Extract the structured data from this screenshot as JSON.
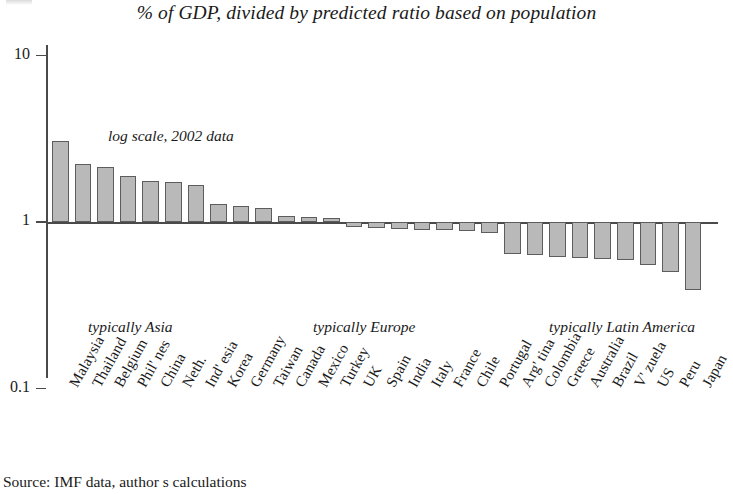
{
  "title": "% of GDP, divided by predicted ratio based on population",
  "annotation": "log scale, 2002 data",
  "source": "Source: IMF data, author s calculations",
  "axis": {
    "ticks": [
      {
        "label": "10",
        "value": 10
      },
      {
        "label": "1",
        "value": 1
      },
      {
        "label": "0.1",
        "value": 0.1
      }
    ]
  },
  "regions": [
    {
      "label": "typically Asia",
      "x": 88
    },
    {
      "label": "typically Europe",
      "x": 313
    },
    {
      "label": "typically Latin America",
      "x": 549
    }
  ],
  "chart_data": {
    "type": "bar",
    "title": "% of GDP, divided by predicted ratio based on population",
    "subtitle": "log scale, 2002 data",
    "xlabel": "",
    "ylabel": "",
    "yscale": "log",
    "ylim": [
      0.1,
      10
    ],
    "yticks": [
      0.1,
      1,
      10
    ],
    "grid": false,
    "legend": null,
    "baseline": 1,
    "source": "Source: IMF data, author s calculations",
    "annotations": [
      "typically Asia",
      "typically Europe",
      "typically Latin America"
    ],
    "categories": [
      "Malaysia",
      "Thailand",
      "Belgium",
      "Phil' nes",
      "China",
      "Neth.",
      "Ind' esia",
      "Korea",
      "Germany",
      "Taiwan",
      "Canada",
      "Mexico",
      "Turkey",
      "UK",
      "Spain",
      "India",
      "Italy",
      "France",
      "Chile",
      "Portugal",
      "Arg' tina",
      "Colombia",
      "Greece",
      "Australia",
      "Brazil",
      "V' zuela",
      "US",
      "Peru",
      "Japan"
    ],
    "values": [
      3.05,
      2.22,
      2.15,
      1.88,
      1.76,
      1.74,
      1.66,
      1.28,
      1.25,
      1.22,
      1.09,
      1.07,
      1.05,
      0.93,
      0.92,
      0.91,
      0.9,
      0.89,
      0.88,
      0.86,
      0.64,
      0.63,
      0.62,
      0.61,
      0.6,
      0.59,
      0.55,
      0.5,
      0.39
    ]
  }
}
